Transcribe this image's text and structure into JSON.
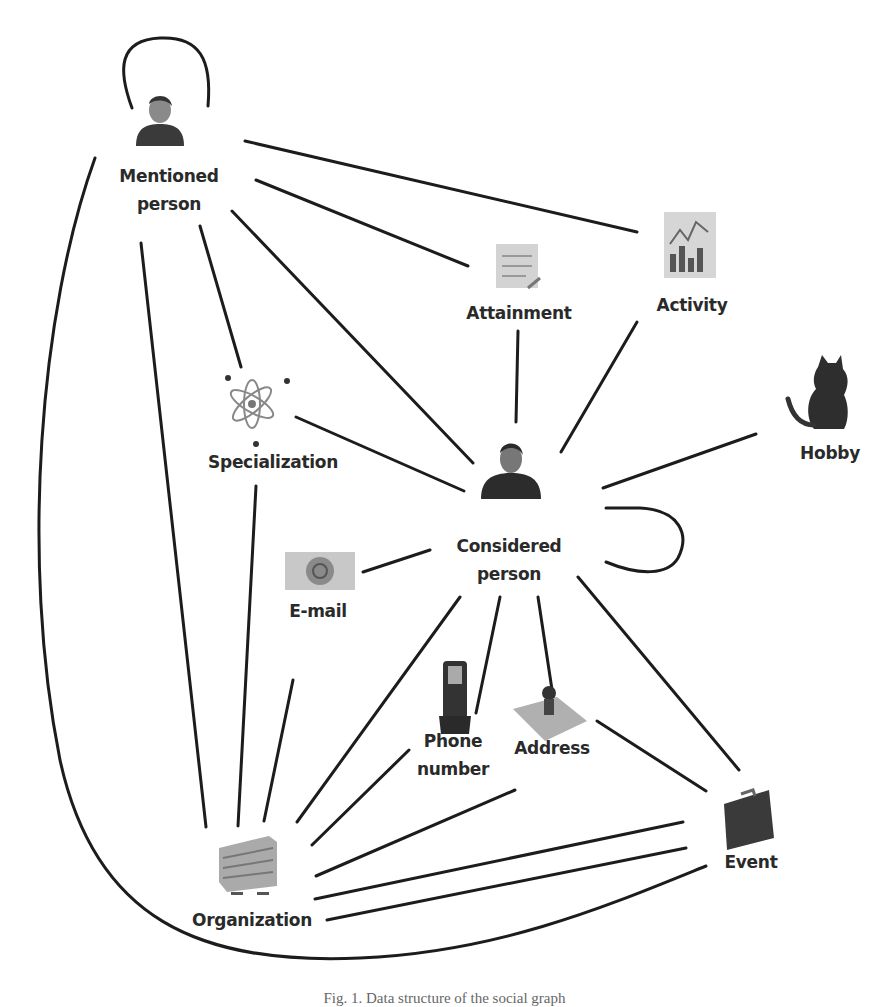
{
  "figure": {
    "caption": "Fig. 1. Data structure of the social graph"
  },
  "nodes": {
    "mentioned_person": {
      "label_line1": "Mentioned",
      "label_line2": "person",
      "icon": "person-icon"
    },
    "attainment": {
      "label": "Attainment",
      "icon": "certificate-icon"
    },
    "activity": {
      "label": "Activity",
      "icon": "chart-icon"
    },
    "specialization": {
      "label": "Specialization",
      "icon": "atom-icon"
    },
    "hobby": {
      "label": "Hobby",
      "icon": "cat-icon"
    },
    "considered_person": {
      "label_line1": "Considered",
      "label_line2": "person",
      "icon": "person-icon"
    },
    "email": {
      "label": "E-mail",
      "icon": "envelope-icon"
    },
    "phone_number": {
      "label_line1": "Phone",
      "label_line2": "number",
      "icon": "phone-icon"
    },
    "address": {
      "label": "Address",
      "icon": "map-pin-icon"
    },
    "event": {
      "label": "Event",
      "icon": "briefcase-icon"
    },
    "organization": {
      "label": "Organization",
      "icon": "building-icon"
    }
  },
  "edges": [
    [
      "Mentioned person",
      "Mentioned person"
    ],
    [
      "Mentioned person",
      "Activity"
    ],
    [
      "Mentioned person",
      "Attainment"
    ],
    [
      "Mentioned person",
      "Considered person"
    ],
    [
      "Mentioned person",
      "Specialization"
    ],
    [
      "Mentioned person",
      "Organization"
    ],
    [
      "Mentioned person",
      "Event"
    ],
    [
      "Attainment",
      "Considered person"
    ],
    [
      "Activity",
      "Considered person"
    ],
    [
      "Hobby",
      "Considered person"
    ],
    [
      "Specialization",
      "Considered person"
    ],
    [
      "Specialization",
      "Organization"
    ],
    [
      "Considered person",
      "Considered person"
    ],
    [
      "E-mail",
      "Considered person"
    ],
    [
      "E-mail",
      "Organization"
    ],
    [
      "Considered person",
      "Organization"
    ],
    [
      "Considered person",
      "Phone number"
    ],
    [
      "Considered person",
      "Address"
    ],
    [
      "Considered person",
      "Event"
    ],
    [
      "Phone number",
      "Organization"
    ],
    [
      "Address",
      "Organization"
    ],
    [
      "Address",
      "Event"
    ],
    [
      "Event",
      "Organization"
    ]
  ],
  "colors": {
    "edge": "#1c1c1c",
    "label": "#2a2a2a",
    "background": "#ffffff"
  }
}
